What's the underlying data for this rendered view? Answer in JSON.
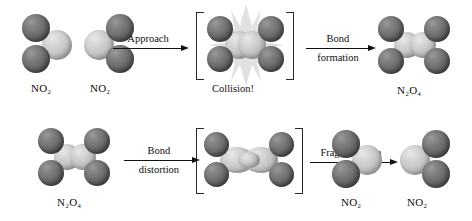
{
  "figure": {
    "background_color": "#ffffff",
    "atom_colors": {
      "oxygen": "#6e6e6e",
      "nitrogen": "#c6c6c6"
    }
  },
  "top_row": {
    "reactant_1_label": "NO₂",
    "reactant_2_label": "NO₂",
    "arrow_1_label": "Approach",
    "intermediate_caption": "Collision!",
    "arrow_2_label_above": "Bond",
    "arrow_2_label_below": "formation",
    "product_label": "N₂O₄"
  },
  "bottom_row": {
    "reactant_label": "N₂O₄",
    "arrow_1_label_above": "Bond",
    "arrow_1_label_below": "distortion",
    "arrow_2_label": "Fragmentation",
    "product_1_label": "NO₂",
    "product_2_label": "NO₂"
  }
}
